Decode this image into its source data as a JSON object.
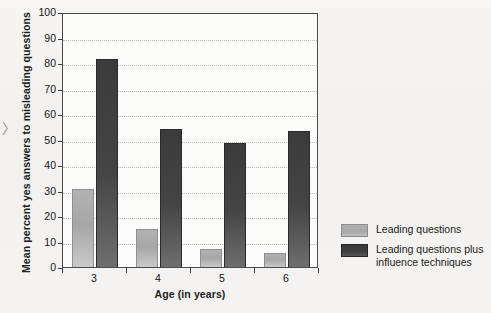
{
  "chart_data": {
    "type": "bar",
    "title": "",
    "subtitle": "",
    "xlabel": "Age (in years)",
    "ylabel": "Mean percent yes answers to misleading questions",
    "categories": [
      "3",
      "4",
      "5",
      "6"
    ],
    "ylim": [
      0,
      100
    ],
    "yticks": [
      0,
      10,
      20,
      30,
      40,
      50,
      60,
      70,
      80,
      90,
      100
    ],
    "ytick_labels": [
      "0",
      "10",
      "20",
      "30",
      "40",
      "50",
      "60",
      "70",
      "80",
      "90",
      "100"
    ],
    "grid": "horizontal-dotted",
    "legend_position": "right",
    "series": [
      {
        "name": "Leading questions",
        "color": "#a8a8a8",
        "values": [
          30.5,
          15,
          7,
          5.5
        ]
      },
      {
        "name": "Leading questions plus influence techniques",
        "color": "#3a3a3a",
        "values": [
          81.5,
          54,
          48.5,
          53.5
        ]
      }
    ]
  },
  "legend": {
    "items": [
      {
        "label": "Leading questions"
      },
      {
        "label": "Leading questions plus\ninfluence techniques"
      }
    ]
  },
  "marks": {
    "edge_chevron": "〉"
  }
}
